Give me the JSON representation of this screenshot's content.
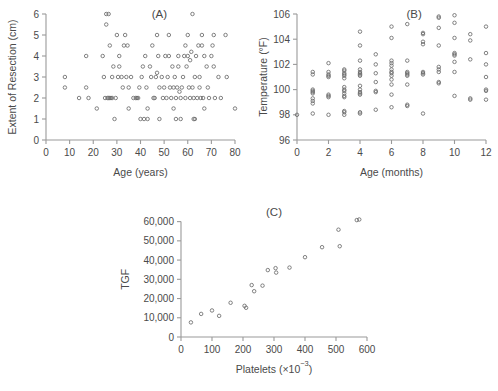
{
  "figure": {
    "background": "#ffffff",
    "point_color": "#6b6b6b",
    "axis_color": "#9a9a9a",
    "text_color": "#4a4a4a"
  },
  "panels": [
    {
      "label": "(A)",
      "name": "panel-a"
    },
    {
      "label": "(B)",
      "name": "panel-b"
    },
    {
      "label": "(C)",
      "name": "panel-c"
    }
  ],
  "chart_data": [
    {
      "type": "scatter",
      "title": "(A)",
      "xlabel": "Age (years)",
      "ylabel": "Extent of Resection (cm)",
      "xlim": [
        0,
        80
      ],
      "ylim": [
        0,
        6
      ],
      "xticks": [
        0,
        10,
        20,
        30,
        40,
        50,
        60,
        70,
        80
      ],
      "yticks": [
        0,
        1,
        2,
        3,
        4,
        5,
        6
      ],
      "xtick_labels": [
        "0",
        "10",
        "20",
        "30",
        "40",
        "50",
        "60",
        "70",
        "80"
      ],
      "ytick_labels": [
        "0",
        "1",
        "2",
        "3",
        "4",
        "5",
        "6"
      ],
      "grid": false,
      "legend": null,
      "points": [
        [
          8,
          3
        ],
        [
          8,
          2.5
        ],
        [
          14,
          2
        ],
        [
          17,
          4
        ],
        [
          17,
          2.5
        ],
        [
          18,
          2
        ],
        [
          21.5,
          1.5
        ],
        [
          24,
          4
        ],
        [
          24.5,
          3
        ],
        [
          25,
          2
        ],
        [
          25.5,
          6
        ],
        [
          25.5,
          5.5
        ],
        [
          26,
          2
        ],
        [
          26.5,
          2
        ],
        [
          26.5,
          6
        ],
        [
          27,
          2
        ],
        [
          27,
          4.5
        ],
        [
          27.5,
          2
        ],
        [
          28,
          2
        ],
        [
          28,
          3
        ],
        [
          28.5,
          3.5
        ],
        [
          29,
          1
        ],
        [
          29.5,
          2
        ],
        [
          30,
          5
        ],
        [
          30.5,
          3
        ],
        [
          31,
          4
        ],
        [
          31,
          3.5
        ],
        [
          32,
          3
        ],
        [
          32.5,
          2.5
        ],
        [
          33,
          4.5
        ],
        [
          33.5,
          5
        ],
        [
          34,
          3
        ],
        [
          34.5,
          4.5
        ],
        [
          35,
          2.5
        ],
        [
          35,
          1.5
        ],
        [
          36,
          3
        ],
        [
          37,
          2
        ],
        [
          38,
          2
        ],
        [
          38.5,
          2
        ],
        [
          39,
          2
        ],
        [
          39.5,
          2.5
        ],
        [
          40,
          1
        ],
        [
          40.5,
          3
        ],
        [
          41,
          3.5
        ],
        [
          41.5,
          1
        ],
        [
          42,
          4
        ],
        [
          42.5,
          2.5
        ],
        [
          43,
          1.5
        ],
        [
          43,
          1
        ],
        [
          44,
          3.5
        ],
        [
          44.5,
          3
        ],
        [
          45,
          4.5
        ],
        [
          45.5,
          2
        ],
        [
          46,
          2
        ],
        [
          46.5,
          3
        ],
        [
          47,
          5
        ],
        [
          47,
          3.2
        ],
        [
          47.5,
          4
        ],
        [
          48,
          2.5
        ],
        [
          48,
          1
        ],
        [
          49,
          3
        ],
        [
          49.5,
          2
        ],
        [
          50,
          2.5
        ],
        [
          50.5,
          4
        ],
        [
          51,
          2
        ],
        [
          51.5,
          3
        ],
        [
          52,
          5
        ],
        [
          52,
          4
        ],
        [
          52.5,
          2.5
        ],
        [
          53,
          2
        ],
        [
          53.5,
          3.5
        ],
        [
          54,
          2.5
        ],
        [
          54,
          1.5
        ],
        [
          54.5,
          3
        ],
        [
          55,
          2
        ],
        [
          55,
          1
        ],
        [
          55.5,
          2.5
        ],
        [
          56,
          3.5
        ],
        [
          56,
          4
        ],
        [
          56.5,
          2.3
        ],
        [
          57,
          2
        ],
        [
          57,
          1
        ],
        [
          57.5,
          2.5
        ],
        [
          58,
          3
        ],
        [
          58.5,
          4
        ],
        [
          59,
          4.5
        ],
        [
          59,
          2
        ],
        [
          59.5,
          3.5
        ],
        [
          60,
          5
        ],
        [
          60,
          4
        ],
        [
          60.5,
          2.5
        ],
        [
          61,
          3.8
        ],
        [
          61,
          2
        ],
        [
          61.5,
          4.2
        ],
        [
          62,
          6
        ],
        [
          62,
          2.5
        ],
        [
          62.5,
          2
        ],
        [
          62.5,
          1
        ],
        [
          63,
          3
        ],
        [
          63,
          1
        ],
        [
          63.5,
          4
        ],
        [
          64,
          2
        ],
        [
          64.5,
          4.5
        ],
        [
          65,
          3
        ],
        [
          65,
          2.5
        ],
        [
          65.5,
          2
        ],
        [
          66,
          5
        ],
        [
          66,
          4.5
        ],
        [
          66.5,
          2
        ],
        [
          67,
          1.5
        ],
        [
          67,
          4
        ],
        [
          68,
          3.5
        ],
        [
          68.5,
          2.5
        ],
        [
          69,
          2
        ],
        [
          70,
          4
        ],
        [
          70.5,
          4.5
        ],
        [
          71,
          5
        ],
        [
          71,
          3.5
        ],
        [
          71.5,
          2
        ],
        [
          73,
          3
        ],
        [
          74,
          2
        ],
        [
          76,
          5
        ],
        [
          76.5,
          3
        ],
        [
          80,
          1.5
        ]
      ]
    },
    {
      "type": "scatter",
      "title": "(B)",
      "xlabel": "Age (months)",
      "ylabel": "Temperature (°F)",
      "xlim": [
        0,
        12
      ],
      "ylim": [
        96,
        106
      ],
      "xticks": [
        0,
        2,
        4,
        6,
        8,
        10,
        12
      ],
      "yticks": [
        96,
        98,
        100,
        102,
        104,
        106
      ],
      "xtick_labels": [
        "0",
        "2",
        "4",
        "6",
        "8",
        "10",
        "12"
      ],
      "ytick_labels": [
        "96",
        "98",
        "100",
        "102",
        "104",
        "106"
      ],
      "grid": false,
      "legend": null,
      "points": [
        [
          0,
          98.0
        ],
        [
          1,
          101.4
        ],
        [
          1,
          101.2
        ],
        [
          1,
          100.0
        ],
        [
          1,
          99.9
        ],
        [
          1,
          99.8
        ],
        [
          1,
          99.7
        ],
        [
          1,
          99.3
        ],
        [
          1,
          99.1
        ],
        [
          1,
          98.9
        ],
        [
          1,
          98.1
        ],
        [
          2,
          102.1
        ],
        [
          2,
          101.4
        ],
        [
          2,
          101.2
        ],
        [
          2,
          101.1
        ],
        [
          2,
          101.0
        ],
        [
          2,
          99.6
        ],
        [
          2,
          99.5
        ],
        [
          2,
          99.4
        ],
        [
          2,
          98.0
        ],
        [
          3,
          101.6
        ],
        [
          3,
          101.5
        ],
        [
          3,
          101.3
        ],
        [
          3,
          101.2
        ],
        [
          3,
          101.1
        ],
        [
          3,
          100.9
        ],
        [
          3,
          100.2
        ],
        [
          3,
          100.0
        ],
        [
          3,
          99.9
        ],
        [
          3,
          99.7
        ],
        [
          3,
          99.5
        ],
        [
          3,
          99.4
        ],
        [
          3,
          98.3
        ],
        [
          3,
          98.2
        ],
        [
          3,
          98.0
        ],
        [
          4,
          104.6
        ],
        [
          4,
          103.5
        ],
        [
          4,
          102.3
        ],
        [
          4,
          101.6
        ],
        [
          4,
          101.4
        ],
        [
          4,
          101.3
        ],
        [
          4,
          101.2
        ],
        [
          4,
          101.1
        ],
        [
          4,
          100.3
        ],
        [
          4,
          100.0
        ],
        [
          4,
          99.8
        ],
        [
          4,
          99.7
        ],
        [
          4,
          99.6
        ],
        [
          4,
          98.2
        ],
        [
          4,
          98.1
        ],
        [
          5,
          102.8
        ],
        [
          5,
          102.0
        ],
        [
          5,
          101.3
        ],
        [
          5,
          100.6
        ],
        [
          5,
          99.9
        ],
        [
          5,
          99.8
        ],
        [
          5,
          98.4
        ],
        [
          6,
          105.0
        ],
        [
          6,
          104.1
        ],
        [
          6,
          102.3
        ],
        [
          6,
          102.1
        ],
        [
          6,
          101.9
        ],
        [
          6,
          101.6
        ],
        [
          6,
          101.4
        ],
        [
          6,
          101.3
        ],
        [
          6,
          101.1
        ],
        [
          6,
          100.8
        ],
        [
          6,
          100.4
        ],
        [
          6,
          99.6
        ],
        [
          6,
          98.6
        ],
        [
          7,
          105.2
        ],
        [
          7,
          102.3
        ],
        [
          7,
          101.4
        ],
        [
          7,
          101.3
        ],
        [
          7,
          101.2
        ],
        [
          7,
          101.1
        ],
        [
          7,
          100.4
        ],
        [
          7,
          98.8
        ],
        [
          7,
          98.7
        ],
        [
          8,
          104.5
        ],
        [
          8,
          104.4
        ],
        [
          8,
          103.8
        ],
        [
          8,
          103.6
        ],
        [
          8,
          101.4
        ],
        [
          8,
          101.3
        ],
        [
          8,
          101.2
        ],
        [
          8,
          98.1
        ],
        [
          9,
          105.8
        ],
        [
          9,
          105.7
        ],
        [
          9,
          104.9
        ],
        [
          9,
          103.5
        ],
        [
          9,
          101.8
        ],
        [
          9,
          101.6
        ],
        [
          9,
          101.4
        ],
        [
          9,
          100.6
        ],
        [
          9,
          100.5
        ],
        [
          10,
          105.9
        ],
        [
          10,
          105.3
        ],
        [
          10,
          104.1
        ],
        [
          10,
          102.9
        ],
        [
          10,
          102.8
        ],
        [
          10,
          102.7
        ],
        [
          10,
          102.2
        ],
        [
          10,
          101.4
        ],
        [
          10,
          99.5
        ],
        [
          11,
          104.4
        ],
        [
          11,
          103.9
        ],
        [
          11,
          102.4
        ],
        [
          11,
          99.3
        ],
        [
          11,
          99.2
        ],
        [
          12,
          105.0
        ],
        [
          12,
          102.9
        ],
        [
          12,
          102.0
        ],
        [
          12,
          101.0
        ],
        [
          12,
          100.0
        ],
        [
          12,
          99.9
        ],
        [
          12,
          99.2
        ]
      ]
    },
    {
      "type": "scatter",
      "title": "(C)",
      "xlabel": "Platelets (×10⁻³)",
      "xlabel_parts": {
        "main": "Platelets (×10",
        "superscript": "−3",
        "tail": ")"
      },
      "ylabel": "TGF",
      "xlim": [
        0,
        600
      ],
      "ylim": [
        0,
        65000
      ],
      "xticks": [
        0,
        100,
        200,
        300,
        400,
        500,
        600
      ],
      "yticks": [
        0,
        10000,
        20000,
        30000,
        40000,
        50000,
        60000
      ],
      "xtick_labels": [
        "0",
        "100",
        "200",
        "300",
        "400",
        "500",
        "600"
      ],
      "ytick_labels": [
        "0",
        "10,000",
        "20,000",
        "30,000",
        "40,000",
        "50,000",
        "60,000"
      ],
      "grid": false,
      "legend": null,
      "points": [
        [
          32,
          7600
        ],
        [
          65,
          12000
        ],
        [
          100,
          13800
        ],
        [
          123,
          11000
        ],
        [
          160,
          17800
        ],
        [
          205,
          16200
        ],
        [
          210,
          15200
        ],
        [
          228,
          27000
        ],
        [
          236,
          23800
        ],
        [
          263,
          26700
        ],
        [
          280,
          34800
        ],
        [
          305,
          35800
        ],
        [
          307,
          33500
        ],
        [
          350,
          36100
        ],
        [
          400,
          41500
        ],
        [
          455,
          46700
        ],
        [
          508,
          55800
        ],
        [
          512,
          47200
        ],
        [
          567,
          60800
        ],
        [
          575,
          61100
        ]
      ]
    }
  ]
}
